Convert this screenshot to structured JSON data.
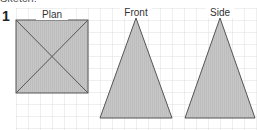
{
  "question": {
    "number": "1",
    "clipped_text": "Sketch:"
  },
  "views": [
    {
      "label": "Plan",
      "shape": "square-with-diagonals"
    },
    {
      "label": "Front",
      "shape": "isosceles-triangle"
    },
    {
      "label": "Side",
      "shape": "isosceles-triangle"
    }
  ],
  "colors": {
    "fill": "#c8c8c8",
    "stroke": "#555555",
    "grid": "#d8d8d8"
  }
}
